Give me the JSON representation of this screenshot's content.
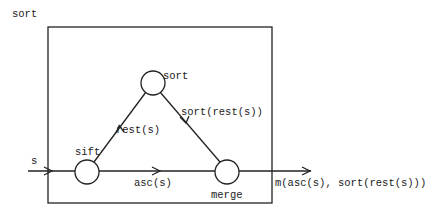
{
  "diagram": {
    "title": "sort",
    "nodes": [
      {
        "id": "sort",
        "label": "sort"
      },
      {
        "id": "sift",
        "label": "sift"
      },
      {
        "id": "merge",
        "label": "merge"
      }
    ],
    "edges": {
      "input": {
        "from": "external",
        "to": "sift",
        "label": "s"
      },
      "rest": {
        "from": "sift",
        "to": "sort",
        "label": "rest(s)"
      },
      "sorted_rest": {
        "from": "sort",
        "to": "merge",
        "label": "sort(rest(s))"
      },
      "asc": {
        "from": "sift",
        "to": "merge",
        "label": "asc(s)"
      },
      "output": {
        "from": "merge",
        "to": "external",
        "label": "m(asc(s), sort(rest(s)))"
      }
    },
    "colors": {
      "stroke": "#222222",
      "background": "#ffffff"
    }
  }
}
